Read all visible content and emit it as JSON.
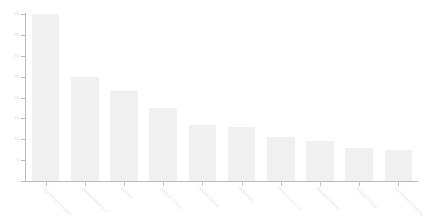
{
  "chart_data": {
    "type": "bar",
    "title": "",
    "subtitle": "",
    "xlabel": "",
    "ylabel": "",
    "ylim": [
      0,
      40
    ],
    "ytick_values": [
      0,
      5,
      10,
      15,
      20,
      25,
      30,
      35,
      40
    ],
    "ytick_labels": [
      "0",
      "5",
      "10",
      "15",
      "20",
      "25",
      "30",
      "35",
      "40"
    ],
    "grid": false,
    "legend": null,
    "legend_position": "none",
    "orientation": "vertical",
    "sorted": "descending",
    "bar_color": "#f0f0f0",
    "axis_color": "#b9b9b9",
    "label_color": "#e2e2e2",
    "xtick_label_rotation": 45,
    "categories": [
      "Engineering & Research",
      "Communications & IT",
      "Business",
      "Computer Science",
      "Applied Sciences",
      "Mathematics",
      "Social Sciences, BS",
      "Biological Sciences",
      "Physical Sciences",
      "Environmental Sciences"
    ],
    "values": [
      40,
      25,
      21.5,
      17.5,
      13.5,
      13,
      10.5,
      9.5,
      8,
      7.5
    ],
    "series": [
      {
        "name": "",
        "values": [
          40,
          25,
          21.5,
          17.5,
          13.5,
          13,
          10.5,
          9.5,
          8,
          7.5
        ]
      }
    ]
  },
  "axes": {
    "y_ticks": [
      {
        "label": "40",
        "value": 40
      },
      {
        "label": "35",
        "value": 35
      },
      {
        "label": "30",
        "value": 30
      },
      {
        "label": "25",
        "value": 25
      },
      {
        "label": "20",
        "value": 20
      },
      {
        "label": "15",
        "value": 15
      },
      {
        "label": "10",
        "value": 10
      },
      {
        "label": "5",
        "value": 5
      },
      {
        "label": "0",
        "value": 0
      }
    ]
  }
}
